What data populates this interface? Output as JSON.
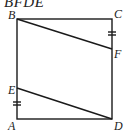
{
  "caption": "BFDE",
  "diagram": {
    "shape": "square",
    "points": {
      "A": {
        "label": "A",
        "x": 17,
        "y": 119
      },
      "B": {
        "label": "B",
        "x": 17,
        "y": 19
      },
      "C": {
        "label": "C",
        "x": 112,
        "y": 19
      },
      "D": {
        "label": "D",
        "x": 112,
        "y": 119
      },
      "E": {
        "label": "E",
        "x": 17,
        "y": 88
      },
      "F": {
        "label": "F",
        "x": 112,
        "y": 49
      }
    },
    "segments": [
      "AB",
      "BC",
      "CD",
      "DA",
      "BF",
      "ED"
    ],
    "equal_marks": [
      "CF",
      "AE"
    ],
    "line_color": "#1a1a1a"
  }
}
